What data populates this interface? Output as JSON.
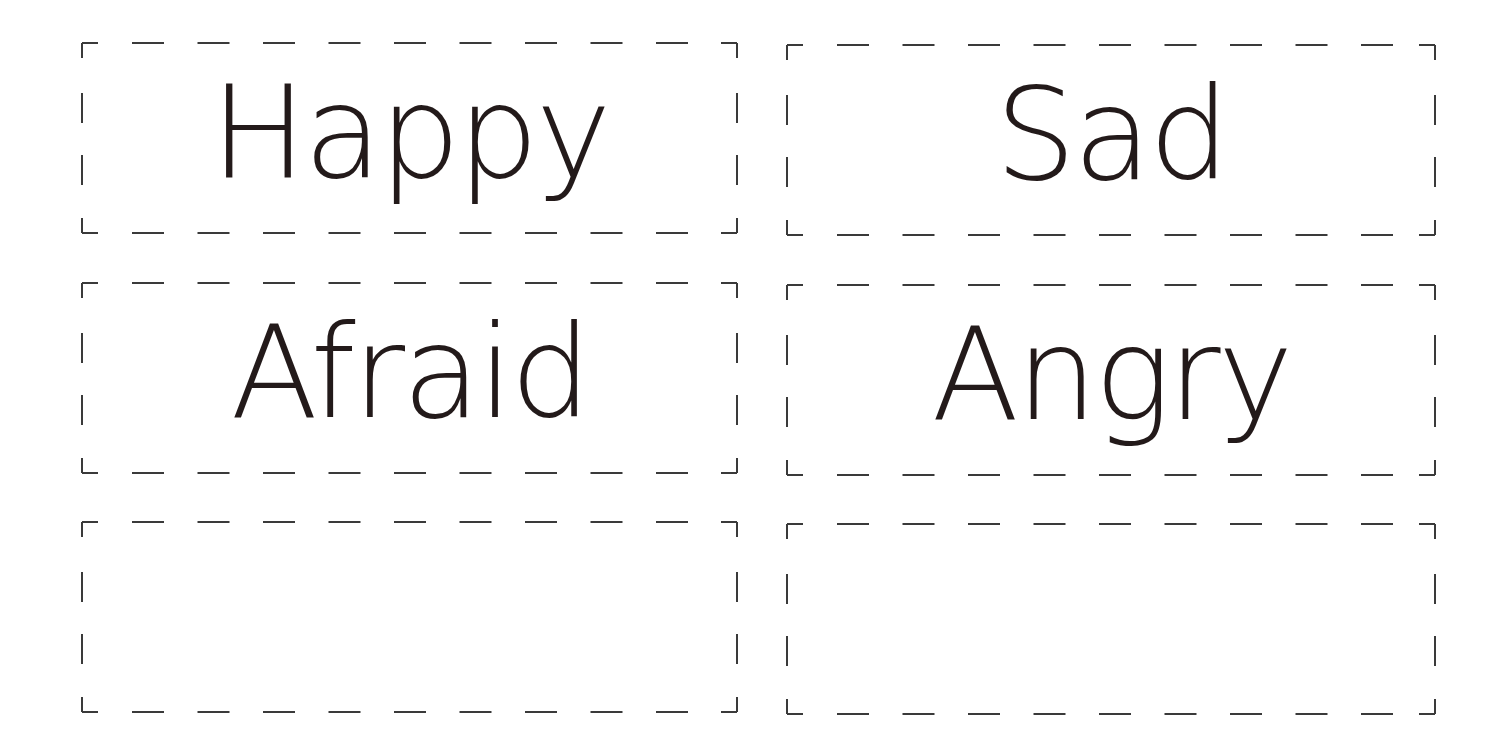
{
  "sheet": {
    "background": "#ffffff",
    "line_color": "#3a3a3a",
    "text_color": "#231a1a",
    "cards": [
      {
        "id": "happy",
        "label": "Happy",
        "x": 82,
        "y": 43,
        "w": 655,
        "h": 190
      },
      {
        "id": "sad",
        "label": "Sad",
        "x": 787,
        "y": 45,
        "w": 648,
        "h": 190
      },
      {
        "id": "afraid",
        "label": "Afraid",
        "x": 82,
        "y": 283,
        "w": 655,
        "h": 190
      },
      {
        "id": "angry",
        "label": "Angry",
        "x": 787,
        "y": 285,
        "w": 648,
        "h": 190
      },
      {
        "id": "blank-1",
        "label": "",
        "x": 82,
        "y": 522,
        "w": 655,
        "h": 190
      },
      {
        "id": "blank-2",
        "label": "",
        "x": 787,
        "y": 524,
        "w": 648,
        "h": 190
      }
    ]
  }
}
